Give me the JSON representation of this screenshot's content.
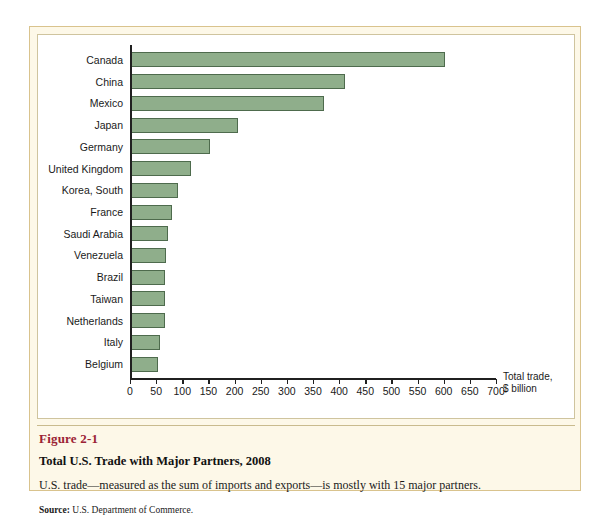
{
  "chart_data": {
    "type": "bar",
    "orientation": "horizontal",
    "title": "Total U.S. Trade with Major Partners, 2008",
    "xlabel": "Total trade, $ billion",
    "ylabel": "",
    "xlim": [
      0,
      700
    ],
    "xticks": [
      0,
      50,
      100,
      150,
      200,
      250,
      300,
      350,
      400,
      450,
      500,
      550,
      600,
      650,
      700
    ],
    "grid": false,
    "legend": null,
    "bar_color": "#8fae8b",
    "bar_border_color": "#4e6b4d",
    "categories": [
      "Canada",
      "China",
      "Mexico",
      "Japan",
      "Germany",
      "United Kingdom",
      "Korea, South",
      "France",
      "Saudi Arabia",
      "Venezuela",
      "Brazil",
      "Taiwan",
      "Netherlands",
      "Italy",
      "Belgium"
    ],
    "values": [
      600,
      410,
      370,
      205,
      152,
      115,
      90,
      78,
      71,
      67,
      65,
      65,
      65,
      56,
      52
    ]
  },
  "axis_unit": {
    "line1": "Total trade,",
    "line2": "$ billion"
  },
  "caption": {
    "figure_number": "Figure 2-1",
    "title": "Total U.S. Trade with Major Partners, 2008",
    "description": "U.S. trade—measured as the sum of imports and exports—is mostly with 15 major partners.",
    "source_label": "Source:",
    "source_text": "U.S. Department of Commerce."
  }
}
